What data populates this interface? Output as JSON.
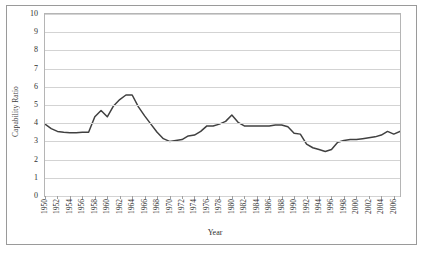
{
  "chart_data": {
    "type": "line",
    "title": "",
    "xlabel": "Year",
    "ylabel": "Capability Ratio",
    "xlim": [
      1950,
      2007
    ],
    "ylim": [
      0,
      10
    ],
    "ytick_values": [
      0,
      1,
      2,
      3,
      4,
      5,
      6,
      7,
      8,
      9,
      10
    ],
    "ytick_labels": [
      "0",
      "1",
      "2",
      "3",
      "4",
      "5",
      "6",
      "7",
      "8",
      "9",
      "10"
    ],
    "xtick_labels": [
      "1950",
      "1952",
      "1954",
      "1956",
      "1958",
      "1960",
      "1962",
      "1964",
      "1966",
      "1968",
      "1970",
      "1972",
      "1974",
      "1976",
      "1978",
      "1980",
      "1982",
      "1984",
      "1986",
      "1988",
      "1990",
      "1992",
      "1994",
      "1996",
      "1998",
      "2000",
      "2002",
      "2004",
      "2006"
    ],
    "xtick_step": 2,
    "grid": "horizontal",
    "legend": "none",
    "line_color": "#404040",
    "x": [
      1950,
      1951,
      1952,
      1953,
      1954,
      1955,
      1956,
      1957,
      1958,
      1959,
      1960,
      1961,
      1962,
      1963,
      1964,
      1965,
      1966,
      1967,
      1968,
      1969,
      1970,
      1971,
      1972,
      1973,
      1974,
      1975,
      1976,
      1977,
      1978,
      1979,
      1980,
      1981,
      1982,
      1983,
      1984,
      1985,
      1986,
      1987,
      1988,
      1989,
      1990,
      1991,
      1992,
      1993,
      1994,
      1995,
      1996,
      1997,
      1998,
      1999,
      2000,
      2001,
      2002,
      2003,
      2004,
      2005,
      2006,
      2007
    ],
    "values": [
      3.95,
      3.7,
      3.55,
      3.5,
      3.48,
      3.47,
      3.5,
      3.5,
      4.35,
      4.7,
      4.35,
      4.95,
      5.3,
      5.55,
      5.55,
      4.9,
      4.4,
      3.95,
      3.5,
      3.15,
      3.0,
      3.05,
      3.1,
      3.3,
      3.35,
      3.55,
      3.85,
      3.85,
      3.95,
      4.1,
      4.45,
      4.05,
      3.85,
      3.85,
      3.85,
      3.85,
      3.85,
      3.9,
      3.9,
      3.8,
      3.45,
      3.4,
      2.85,
      2.65,
      2.55,
      2.45,
      2.55,
      2.95,
      3.05,
      3.1,
      3.1,
      3.15,
      3.2,
      3.25,
      3.35,
      3.55,
      3.4,
      3.55
    ]
  }
}
